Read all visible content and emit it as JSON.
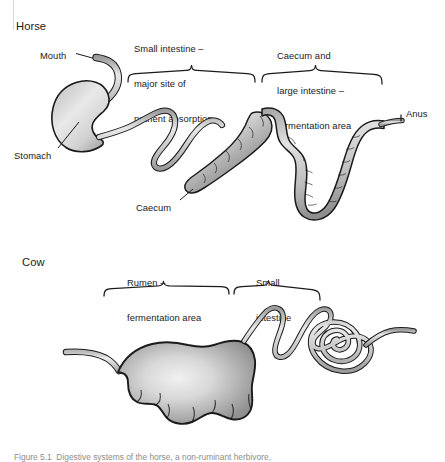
{
  "figure": {
    "caption": "Figure 5.1  Digestive systems of the horse, a non-ruminant herbivore,",
    "background_color": "#ffffff",
    "ink_color": "#1a1a1a",
    "organ_fill_light": "#e6e6e6",
    "organ_fill_mid": "#b5b5b5",
    "organ_fill_dark": "#8a8a8a"
  },
  "horse": {
    "title": "Horse",
    "labels": {
      "mouth": "Mouth",
      "stomach": "Stomach",
      "caecum": "Caecum",
      "anus": "Anus"
    },
    "brackets": [
      {
        "id": "small-intestine",
        "lines": [
          "Small intestine –",
          "major site of",
          "nutrient absorption"
        ]
      },
      {
        "id": "caecum-large-intestine",
        "lines": [
          "Caecum and",
          "large intestine –",
          "fermentation area"
        ]
      }
    ]
  },
  "cow": {
    "title": "Cow",
    "brackets": [
      {
        "id": "rumen",
        "lines": [
          "Rumen –",
          "fermentation area"
        ]
      },
      {
        "id": "small-intestine",
        "lines": [
          "Small",
          "intestine"
        ]
      }
    ]
  }
}
